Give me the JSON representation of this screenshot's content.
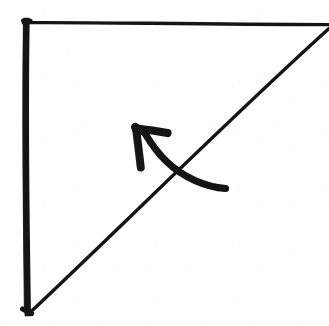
{
  "figure": {
    "kind": "hand-drawn-fold-diagram",
    "title": "",
    "caption": "",
    "background_color": "#ffffff",
    "ink_color": "#151515",
    "canvas": {
      "width": 329,
      "height": 326
    }
  },
  "chart_data": {
    "type": "diagram",
    "title": "",
    "xlabel": "",
    "ylabel": "",
    "strokes": [
      {
        "name": "left-edge",
        "role": "paper-edge",
        "style": "thick-straight",
        "stroke_width": 6,
        "points": [
          [
            26,
            22
          ],
          [
            28,
            313
          ]
        ]
      },
      {
        "name": "top-edge",
        "role": "paper-edge",
        "style": "thin-straight",
        "stroke_width": 3.2,
        "points": [
          [
            24,
            23
          ],
          [
            329,
            25
          ]
        ]
      },
      {
        "name": "diagonal-fold-line",
        "role": "fold-crease",
        "style": "thin-straight",
        "stroke_width": 3.2,
        "points": [
          [
            29,
            312
          ],
          [
            329,
            29
          ]
        ]
      },
      {
        "name": "fold-direction-arrow-shaft",
        "role": "motion-arrow",
        "style": "curved",
        "stroke_width": 7,
        "points": [
          [
            225,
            188
          ],
          [
            196,
            182
          ],
          [
            166,
            162
          ],
          [
            146,
            136
          ]
        ]
      },
      {
        "name": "fold-direction-arrow-head-upper-barb",
        "role": "arrowhead",
        "style": "straight",
        "stroke_width": 8,
        "points": [
          [
            136,
            128
          ],
          [
            168,
            133
          ]
        ]
      },
      {
        "name": "fold-direction-arrow-head-lower-barb",
        "role": "arrowhead",
        "style": "straight",
        "stroke_width": 8,
        "points": [
          [
            136,
            128
          ],
          [
            141,
            168
          ]
        ]
      }
    ],
    "arrow": {
      "tip": [
        136,
        128
      ],
      "tail": [
        225,
        188
      ],
      "direction": "up-left",
      "meaning": "fold toward upper left"
    },
    "legend": [],
    "annotations": []
  }
}
